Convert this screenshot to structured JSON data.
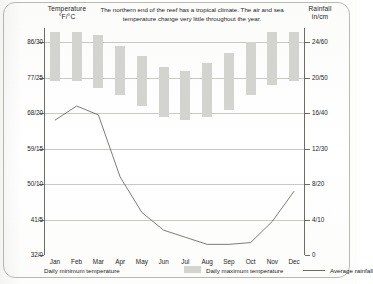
{
  "titles": {
    "left_axis": "Temperature\n°F/°C",
    "left_axis_line1": "Temperature",
    "left_axis_line2": "°F/°C",
    "right_axis_line1": "Rainfall",
    "right_axis_line2": "in/cm"
  },
  "caption": "The northern end of the reef has a tropical climate. The air and sea temperature change very little throughout the year.",
  "legend": {
    "min_label": "Daily minimum temperature",
    "max_label": "Daily maximum temperature",
    "rain_label": "Average rainfall"
  },
  "chart_data": {
    "type": "bar",
    "title": "",
    "subtitle": "The northern end of the reef has a tropical climate. The air and sea temperature change very little throughout the year.",
    "categories": [
      "Jan",
      "Feb",
      "Mar",
      "Apr",
      "May",
      "Jun",
      "Jul",
      "Aug",
      "Sep",
      "Oct",
      "Nov",
      "Dec"
    ],
    "xlabel": "",
    "ylabel": "Temperature °F/°C",
    "y2label": "Rainfall in/cm",
    "grid": true,
    "legend_position": "bottom",
    "yticks_left": [
      "86/30",
      "77/25",
      "68/20",
      "59/15",
      "50/10",
      "41/5",
      "32/0"
    ],
    "yticks_left_c": [
      30,
      25,
      20,
      15,
      10,
      5,
      0
    ],
    "yticks_right": [
      "24/60",
      "20/50",
      "16/40",
      "12/30",
      "8/20",
      "4/10",
      "0"
    ],
    "yticks_right_cm": [
      60,
      50,
      40,
      30,
      20,
      10,
      0
    ],
    "ylim_left_c": [
      0,
      32
    ],
    "ylim_right_cm": [
      0,
      64
    ],
    "series": [
      {
        "name": "Daily maximum temperature",
        "type": "bar-range-top",
        "unit": "°C",
        "values": [
          31.5,
          31.5,
          31.0,
          29.5,
          28.0,
          26.5,
          26.0,
          27.0,
          28.5,
          30.0,
          31.5,
          31.5
        ]
      },
      {
        "name": "Daily minimum temperature",
        "type": "bar-range-bottom",
        "unit": "°C",
        "values": [
          24.5,
          24.5,
          23.5,
          22.5,
          21.0,
          19.5,
          19.0,
          19.5,
          20.5,
          22.5,
          24.0,
          24.5
        ]
      },
      {
        "name": "Average rainfall",
        "type": "line",
        "unit": "cm",
        "values": [
          38.0,
          42.0,
          39.5,
          22.0,
          12.0,
          7.0,
          5.0,
          3.0,
          3.0,
          3.5,
          9.5,
          18.0
        ]
      }
    ]
  }
}
